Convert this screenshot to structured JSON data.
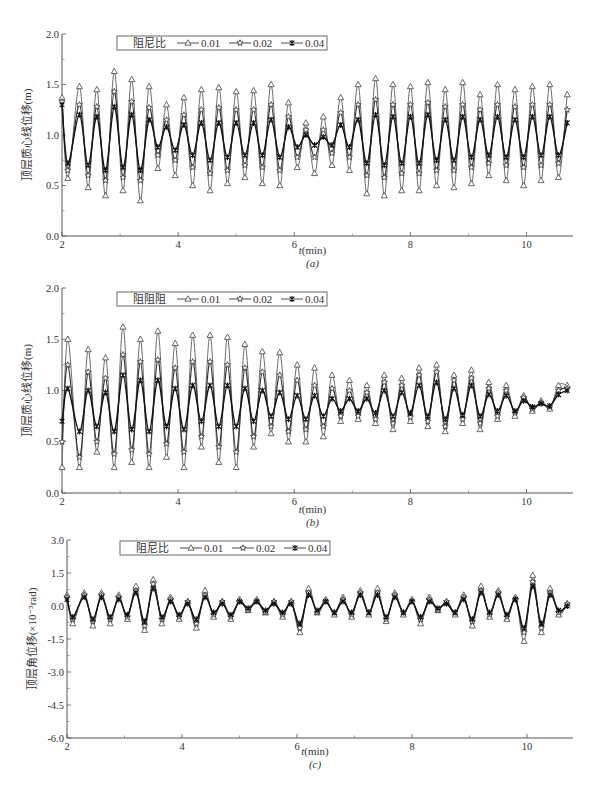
{
  "figure": {
    "panels": [
      {
        "id": "a",
        "caption": "(a)",
        "xlabel": "t(min)",
        "ylabel": "顶层质心线位移(m)",
        "legend_title": "阻尼比",
        "yticks": [
          "0.0",
          "0.5",
          "1.0",
          "1.5",
          "2.0"
        ],
        "xticks": [
          "2",
          "4",
          "6",
          "8",
          "10"
        ]
      },
      {
        "id": "b",
        "caption": "(b)",
        "xlabel": "t(min)",
        "ylabel": "顶层质心线位移(m)",
        "legend_title": "阻阻阻",
        "yticks": [
          "0.0",
          "0.5",
          "1.0",
          "1.5",
          "2.0"
        ],
        "xticks": [
          "2",
          "4",
          "6",
          "8",
          "10"
        ]
      },
      {
        "id": "c",
        "caption": "(c)",
        "xlabel": "t(min)",
        "ylabel": "顶层角位移(×10⁻³rad)",
        "legend_title": "阻尼比",
        "yticks": [
          "-6.0",
          "-4.5",
          "-3.0",
          "-1.5",
          "0.0",
          "1.5",
          "3.0"
        ],
        "xticks": [
          "2",
          "4",
          "6",
          "8",
          "10"
        ]
      }
    ],
    "legend_labels": [
      "0.01",
      "0.02",
      "0.04"
    ],
    "legend_markers": [
      "triangle-open",
      "star-open",
      "asterisk-filled"
    ]
  },
  "chart_data": [
    {
      "type": "line",
      "title": "(a)",
      "xlabel": "t(min)",
      "ylabel": "顶层质心线位移(m)",
      "xlim": [
        2,
        10.8
      ],
      "ylim": [
        0.0,
        2.0
      ],
      "xticks": [
        2,
        4,
        6,
        8,
        10
      ],
      "yticks": [
        0.0,
        0.5,
        1.0,
        1.5,
        2.0
      ],
      "legend_title": "阻尼比",
      "legend_position": "upper left (inside)",
      "grid": false,
      "x": [
        2.0,
        2.1,
        2.3,
        2.45,
        2.6,
        2.75,
        2.9,
        3.05,
        3.2,
        3.35,
        3.5,
        3.65,
        3.8,
        3.95,
        4.1,
        4.25,
        4.4,
        4.55,
        4.7,
        4.85,
        5.0,
        5.15,
        5.3,
        5.45,
        5.6,
        5.75,
        5.9,
        6.05,
        6.2,
        6.35,
        6.5,
        6.65,
        6.8,
        6.95,
        7.1,
        7.25,
        7.4,
        7.55,
        7.7,
        7.85,
        8.0,
        8.15,
        8.3,
        8.45,
        8.6,
        8.75,
        8.9,
        9.05,
        9.2,
        9.35,
        9.5,
        9.65,
        9.8,
        9.95,
        10.1,
        10.25,
        10.4,
        10.55,
        10.7
      ],
      "series": [
        {
          "name": "0.01",
          "values": [
            1.37,
            0.57,
            1.48,
            0.48,
            1.45,
            0.4,
            1.63,
            0.45,
            1.55,
            0.35,
            1.48,
            0.67,
            1.3,
            0.6,
            1.37,
            0.5,
            1.45,
            0.45,
            1.47,
            0.52,
            1.43,
            0.58,
            1.44,
            0.52,
            1.5,
            0.5,
            1.32,
            0.68,
            1.12,
            0.62,
            1.18,
            0.7,
            1.37,
            0.65,
            1.5,
            0.42,
            1.56,
            0.4,
            1.5,
            0.45,
            1.48,
            0.45,
            1.52,
            0.5,
            1.45,
            0.48,
            1.52,
            0.52,
            1.4,
            0.6,
            1.5,
            0.55,
            1.45,
            0.5,
            1.48,
            0.55,
            1.5,
            0.58,
            1.4
          ]
        },
        {
          "name": "0.02",
          "values": [
            1.33,
            0.65,
            1.3,
            0.6,
            1.28,
            0.55,
            1.43,
            0.58,
            1.33,
            0.55,
            1.27,
            0.8,
            1.15,
            0.75,
            1.2,
            0.68,
            1.25,
            0.62,
            1.27,
            0.65,
            1.25,
            0.7,
            1.25,
            0.68,
            1.3,
            0.65,
            1.18,
            0.78,
            1.05,
            0.78,
            1.05,
            0.82,
            1.22,
            0.78,
            1.3,
            0.6,
            1.35,
            0.58,
            1.3,
            0.62,
            1.3,
            0.62,
            1.32,
            0.65,
            1.28,
            0.65,
            1.3,
            0.68,
            1.25,
            0.72,
            1.3,
            0.7,
            1.28,
            0.68,
            1.3,
            0.7,
            1.3,
            0.72,
            1.25
          ]
        },
        {
          "name": "0.04",
          "values": [
            1.3,
            0.72,
            1.2,
            0.7,
            1.18,
            0.65,
            1.28,
            0.68,
            1.2,
            0.65,
            1.15,
            0.88,
            1.08,
            0.85,
            1.1,
            0.8,
            1.12,
            0.75,
            1.12,
            0.78,
            1.12,
            0.8,
            1.12,
            0.8,
            1.15,
            0.78,
            1.08,
            0.88,
            1.0,
            0.9,
            0.98,
            0.9,
            1.1,
            0.88,
            1.15,
            0.72,
            1.2,
            0.7,
            1.18,
            0.72,
            1.18,
            0.72,
            1.2,
            0.75,
            1.15,
            0.75,
            1.18,
            0.78,
            1.15,
            0.8,
            1.18,
            0.78,
            1.15,
            0.78,
            1.18,
            0.8,
            1.18,
            0.8,
            1.12
          ]
        }
      ]
    },
    {
      "type": "line",
      "title": "(b)",
      "xlabel": "t(min)",
      "ylabel": "顶层质心线位移(m)",
      "xlim": [
        2,
        10.8
      ],
      "ylim": [
        0.0,
        2.0
      ],
      "xticks": [
        2,
        4,
        6,
        8,
        10
      ],
      "yticks": [
        0.0,
        0.5,
        1.0,
        1.5,
        2.0
      ],
      "legend_title": "阻阻阻",
      "legend_position": "upper left (inside)",
      "grid": false,
      "x": [
        2.0,
        2.1,
        2.3,
        2.45,
        2.6,
        2.75,
        2.9,
        3.05,
        3.2,
        3.35,
        3.5,
        3.65,
        3.8,
        3.95,
        4.1,
        4.25,
        4.4,
        4.55,
        4.7,
        4.85,
        5.0,
        5.15,
        5.3,
        5.45,
        5.6,
        5.75,
        5.9,
        6.05,
        6.2,
        6.35,
        6.5,
        6.65,
        6.8,
        6.95,
        7.1,
        7.25,
        7.4,
        7.55,
        7.7,
        7.85,
        8.0,
        8.15,
        8.3,
        8.45,
        8.6,
        8.75,
        8.9,
        9.05,
        9.2,
        9.35,
        9.5,
        9.65,
        9.8,
        9.95,
        10.1,
        10.25,
        10.4,
        10.55,
        10.7
      ],
      "series": [
        {
          "name": "0.01",
          "values": [
            0.25,
            1.5,
            0.25,
            1.4,
            0.4,
            1.32,
            0.25,
            1.62,
            0.3,
            1.5,
            0.25,
            1.58,
            0.35,
            1.46,
            0.25,
            1.54,
            0.45,
            1.54,
            0.3,
            1.52,
            0.25,
            1.45,
            0.45,
            1.38,
            0.58,
            1.37,
            0.5,
            1.25,
            0.5,
            1.22,
            0.55,
            1.15,
            0.7,
            1.1,
            0.72,
            1.05,
            0.68,
            1.15,
            0.62,
            1.12,
            0.7,
            1.22,
            0.65,
            1.25,
            0.6,
            1.15,
            0.68,
            1.2,
            0.62,
            1.08,
            0.72,
            1.05,
            0.75,
            0.95,
            0.8,
            0.9,
            0.82,
            1.05,
            1.05
          ]
        },
        {
          "name": "0.02",
          "values": [
            0.5,
            1.25,
            0.35,
            1.18,
            0.5,
            1.12,
            0.38,
            1.35,
            0.42,
            1.28,
            0.38,
            1.3,
            0.48,
            1.22,
            0.4,
            1.28,
            0.55,
            1.28,
            0.45,
            1.25,
            0.4,
            1.22,
            0.55,
            1.18,
            0.65,
            1.15,
            0.6,
            1.1,
            0.62,
            1.05,
            0.65,
            1.02,
            0.75,
            1.0,
            0.75,
            0.98,
            0.72,
            1.08,
            0.68,
            1.05,
            0.74,
            1.15,
            0.7,
            1.18,
            0.65,
            1.1,
            0.72,
            1.12,
            0.68,
            1.02,
            0.75,
            1.0,
            0.78,
            0.93,
            0.82,
            0.88,
            0.84,
            1.0,
            1.02
          ]
        },
        {
          "name": "0.04",
          "values": [
            0.7,
            1.02,
            0.6,
            1.0,
            0.65,
            0.98,
            0.6,
            1.15,
            0.62,
            1.1,
            0.6,
            1.1,
            0.65,
            1.02,
            0.62,
            1.05,
            0.7,
            1.05,
            0.65,
            1.05,
            0.65,
            1.02,
            0.7,
            1.0,
            0.75,
            0.98,
            0.72,
            0.95,
            0.72,
            0.95,
            0.75,
            0.92,
            0.8,
            0.92,
            0.8,
            0.92,
            0.78,
            1.0,
            0.75,
            0.98,
            0.78,
            1.05,
            0.75,
            1.08,
            0.72,
            1.02,
            0.76,
            1.05,
            0.75,
            0.96,
            0.8,
            0.95,
            0.8,
            0.9,
            0.84,
            0.87,
            0.85,
            0.96,
            1.0
          ]
        }
      ]
    },
    {
      "type": "line",
      "title": "(c)",
      "xlabel": "t(min)",
      "ylabel": "顶层角位移(×10⁻³rad)",
      "xlim": [
        2,
        10.8
      ],
      "ylim": [
        -6.0,
        3.0
      ],
      "xticks": [
        2,
        4,
        6,
        8,
        10
      ],
      "yticks": [
        -6.0,
        -4.5,
        -3.0,
        -1.5,
        0.0,
        1.5,
        3.0
      ],
      "legend_title": "阻尼比",
      "legend_position": "upper left (inside)",
      "grid": false,
      "x": [
        2.0,
        2.1,
        2.3,
        2.45,
        2.6,
        2.75,
        2.9,
        3.05,
        3.2,
        3.35,
        3.5,
        3.65,
        3.8,
        3.95,
        4.1,
        4.25,
        4.4,
        4.55,
        4.7,
        4.85,
        5.0,
        5.15,
        5.3,
        5.45,
        5.6,
        5.75,
        5.9,
        6.05,
        6.2,
        6.35,
        6.5,
        6.65,
        6.8,
        6.95,
        7.1,
        7.25,
        7.4,
        7.55,
        7.7,
        7.85,
        8.0,
        8.15,
        8.3,
        8.45,
        8.6,
        8.75,
        8.9,
        9.05,
        9.2,
        9.35,
        9.5,
        9.65,
        9.8,
        9.95,
        10.1,
        10.25,
        10.4,
        10.55,
        10.7
      ],
      "series": [
        {
          "name": "0.01",
          "values": [
            0.5,
            -0.8,
            0.6,
            -0.9,
            0.6,
            -0.8,
            0.5,
            -0.6,
            0.9,
            -1.1,
            1.2,
            -0.8,
            0.4,
            -0.6,
            0.2,
            -1.0,
            0.7,
            -0.5,
            0.2,
            -0.6,
            0.3,
            -0.2,
            0.3,
            -0.3,
            0.2,
            -0.5,
            0.2,
            -1.2,
            0.8,
            -0.3,
            0.3,
            -0.4,
            0.4,
            -0.5,
            0.7,
            -0.4,
            0.8,
            -0.7,
            0.6,
            -0.4,
            0.3,
            -0.8,
            0.4,
            -0.2,
            0.2,
            -0.4,
            0.5,
            -0.9,
            0.9,
            -0.5,
            0.7,
            -0.6,
            0.4,
            -1.6,
            1.4,
            -1.2,
            0.8,
            -0.4,
            0.1
          ]
        },
        {
          "name": "0.02",
          "values": [
            0.4,
            -0.6,
            0.5,
            -0.7,
            0.5,
            -0.6,
            0.4,
            -0.5,
            0.7,
            -0.9,
            1.0,
            -0.6,
            0.3,
            -0.5,
            0.2,
            -0.8,
            0.5,
            -0.4,
            0.2,
            -0.5,
            0.2,
            -0.2,
            0.2,
            -0.3,
            0.2,
            -0.4,
            0.2,
            -1.0,
            0.6,
            -0.3,
            0.2,
            -0.3,
            0.3,
            -0.4,
            0.6,
            -0.3,
            0.6,
            -0.6,
            0.5,
            -0.3,
            0.2,
            -0.6,
            0.3,
            -0.2,
            0.2,
            -0.3,
            0.4,
            -0.7,
            0.7,
            -0.4,
            0.6,
            -0.5,
            0.3,
            -1.2,
            1.1,
            -1.0,
            0.6,
            -0.3,
            0.1
          ]
        },
        {
          "name": "0.04",
          "values": [
            0.3,
            -0.5,
            0.4,
            -0.6,
            0.4,
            -0.5,
            0.3,
            -0.4,
            0.6,
            -0.7,
            0.8,
            -0.5,
            0.2,
            -0.4,
            0.1,
            -0.6,
            0.4,
            -0.3,
            0.1,
            -0.4,
            0.2,
            -0.1,
            0.2,
            -0.2,
            0.1,
            -0.3,
            0.1,
            -0.8,
            0.5,
            -0.2,
            0.2,
            -0.3,
            0.2,
            -0.3,
            0.5,
            -0.3,
            0.5,
            -0.5,
            0.4,
            -0.3,
            0.2,
            -0.5,
            0.2,
            -0.1,
            0.1,
            -0.3,
            0.3,
            -0.6,
            0.6,
            -0.3,
            0.5,
            -0.4,
            0.3,
            -1.0,
            0.9,
            -0.8,
            0.5,
            -0.2,
            0.0
          ]
        }
      ]
    }
  ]
}
